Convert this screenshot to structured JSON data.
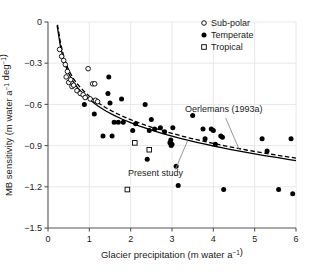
{
  "chart_data": {
    "type": "scatter",
    "title": "",
    "xlabel": "Glacier precipitation (m water a⁻¹)",
    "ylabel": "MB sensitivity (m water a⁻¹ deg⁻¹)",
    "xlim": [
      0,
      6
    ],
    "ylim": [
      -1.5,
      0
    ],
    "xticks": [
      "0",
      "1",
      "2",
      "3",
      "4",
      "5",
      "6"
    ],
    "yticks": [
      "0",
      "−0.3",
      "−0.6",
      "−0.9",
      "−1.2",
      "−1.5"
    ],
    "xtick_values": [
      0,
      1,
      2,
      3,
      4,
      5,
      6
    ],
    "ytick_values": [
      0,
      -0.3,
      -0.6,
      -0.9,
      -1.2,
      -1.5
    ],
    "grid": true,
    "grid_color": "#e8e8e8",
    "legend_position": "top-right",
    "legend": [
      {
        "label": "Sub-polar",
        "marker": "open-circle"
      },
      {
        "label": "Temperate",
        "marker": "filled-circle"
      },
      {
        "label": "Tropical",
        "marker": "open-square"
      }
    ],
    "series": [
      {
        "name": "Sub-polar",
        "marker": "open-circle",
        "color": "#000000",
        "points": [
          [
            0.28,
            -0.2
          ],
          [
            0.33,
            -0.25
          ],
          [
            0.38,
            -0.28
          ],
          [
            0.42,
            -0.31
          ],
          [
            0.44,
            -0.4
          ],
          [
            0.47,
            -0.36
          ],
          [
            0.5,
            -0.44
          ],
          [
            0.55,
            -0.42
          ],
          [
            0.58,
            -0.47
          ],
          [
            0.62,
            -0.46
          ],
          [
            0.7,
            -0.5
          ],
          [
            0.78,
            -0.52
          ],
          [
            0.85,
            -0.53
          ],
          [
            0.9,
            -0.55
          ],
          [
            0.97,
            -0.34
          ],
          [
            1.02,
            -0.56
          ],
          [
            1.08,
            -0.45
          ],
          [
            1.13,
            -0.45
          ],
          [
            1.15,
            -0.57
          ],
          [
            1.2,
            -0.58
          ]
        ]
      },
      {
        "name": "Temperate",
        "marker": "filled-circle",
        "color": "#000000",
        "points": [
          [
            0.88,
            -0.6
          ],
          [
            1.12,
            -0.67
          ],
          [
            1.33,
            -0.83
          ],
          [
            1.45,
            -0.52
          ],
          [
            1.47,
            -0.4
          ],
          [
            1.5,
            -0.59
          ],
          [
            1.55,
            -0.83
          ],
          [
            1.6,
            -0.73
          ],
          [
            1.7,
            -0.73
          ],
          [
            1.78,
            -0.56
          ],
          [
            1.82,
            -0.73
          ],
          [
            2.05,
            -0.79
          ],
          [
            2.12,
            -0.74
          ],
          [
            2.35,
            -0.6
          ],
          [
            2.4,
            -1.0
          ],
          [
            2.45,
            -0.79
          ],
          [
            2.5,
            -0.71
          ],
          [
            2.58,
            -0.78
          ],
          [
            2.72,
            -0.77
          ],
          [
            2.82,
            -0.8
          ],
          [
            2.95,
            -0.88
          ],
          [
            2.97,
            -0.86
          ],
          [
            2.98,
            -0.9
          ],
          [
            3.0,
            -0.89
          ],
          [
            3.02,
            -0.77
          ],
          [
            3.1,
            -1.05
          ],
          [
            3.15,
            -1.19
          ],
          [
            3.5,
            -0.68
          ],
          [
            3.75,
            -0.78
          ],
          [
            3.8,
            -0.85
          ],
          [
            3.95,
            -0.78
          ],
          [
            4.0,
            -0.79
          ],
          [
            4.05,
            -0.89
          ],
          [
            4.18,
            -0.83
          ],
          [
            4.22,
            -0.84
          ],
          [
            4.25,
            -1.22
          ],
          [
            5.18,
            -0.85
          ],
          [
            5.3,
            -0.94
          ],
          [
            5.58,
            -1.22
          ],
          [
            5.88,
            -0.85
          ],
          [
            5.92,
            -1.25
          ]
        ]
      },
      {
        "name": "Tropical",
        "marker": "open-square",
        "color": "#000000",
        "points": [
          [
            2.1,
            -0.88
          ],
          [
            2.45,
            -0.93
          ],
          [
            1.92,
            -1.22
          ]
        ]
      }
    ],
    "curves": [
      {
        "name": "Present study",
        "style": "solid",
        "color": "#000000",
        "points": [
          [
            0.22,
            -0.025
          ],
          [
            0.3,
            -0.175
          ],
          [
            0.4,
            -0.3
          ],
          [
            0.5,
            -0.375
          ],
          [
            0.6,
            -0.43
          ],
          [
            0.7,
            -0.473
          ],
          [
            0.8,
            -0.508
          ],
          [
            0.9,
            -0.538
          ],
          [
            1.0,
            -0.565
          ],
          [
            1.2,
            -0.61
          ],
          [
            1.4,
            -0.648
          ],
          [
            1.6,
            -0.68
          ],
          [
            1.8,
            -0.708
          ],
          [
            2.0,
            -0.733
          ],
          [
            2.2,
            -0.756
          ],
          [
            2.4,
            -0.777
          ],
          [
            2.6,
            -0.796
          ],
          [
            2.8,
            -0.814
          ],
          [
            3.0,
            -0.831
          ],
          [
            3.2,
            -0.847
          ],
          [
            3.4,
            -0.862
          ],
          [
            3.6,
            -0.876
          ],
          [
            3.8,
            -0.89
          ],
          [
            4.0,
            -0.903
          ],
          [
            4.2,
            -0.915
          ],
          [
            4.4,
            -0.927
          ],
          [
            4.6,
            -0.939
          ],
          [
            4.8,
            -0.95
          ],
          [
            5.0,
            -0.96
          ],
          [
            5.2,
            -0.971
          ],
          [
            5.4,
            -0.981
          ],
          [
            5.6,
            -0.99
          ],
          [
            5.8,
            -1.0
          ],
          [
            6.0,
            -1.009
          ]
        ]
      },
      {
        "name": "Oerlemans (1993a)",
        "style": "dashed",
        "color": "#000000",
        "points": [
          [
            0.23,
            -0.02
          ],
          [
            0.3,
            -0.15
          ],
          [
            0.4,
            -0.275
          ],
          [
            0.5,
            -0.35
          ],
          [
            0.6,
            -0.405
          ],
          [
            0.7,
            -0.448
          ],
          [
            0.8,
            -0.483
          ],
          [
            0.9,
            -0.513
          ],
          [
            1.0,
            -0.54
          ],
          [
            1.2,
            -0.586
          ],
          [
            1.4,
            -0.624
          ],
          [
            1.6,
            -0.657
          ],
          [
            1.8,
            -0.685
          ],
          [
            2.0,
            -0.711
          ],
          [
            2.2,
            -0.734
          ],
          [
            2.4,
            -0.756
          ],
          [
            2.6,
            -0.775
          ],
          [
            2.8,
            -0.794
          ],
          [
            3.0,
            -0.811
          ],
          [
            3.2,
            -0.827
          ],
          [
            3.4,
            -0.843
          ],
          [
            3.6,
            -0.857
          ],
          [
            3.8,
            -0.871
          ],
          [
            4.0,
            -0.884
          ],
          [
            4.2,
            -0.897
          ],
          [
            4.4,
            -0.909
          ],
          [
            4.6,
            -0.921
          ],
          [
            4.8,
            -0.932
          ],
          [
            5.0,
            -0.943
          ],
          [
            5.2,
            -0.953
          ],
          [
            5.4,
            -0.963
          ],
          [
            5.6,
            -0.973
          ],
          [
            5.8,
            -0.982
          ],
          [
            6.0,
            -0.991
          ]
        ]
      }
    ],
    "annotations": [
      {
        "text": "Oerlemans (1993a)",
        "text_x": 4.25,
        "text_y": -0.655,
        "leader_from": [
          4.3,
          -0.7
        ],
        "leader_to": [
          4.62,
          -0.925
        ]
      },
      {
        "text": "Present study",
        "text_x": 2.6,
        "text_y": -1.12,
        "leader_from": [
          3.08,
          -1.075
        ],
        "leader_to": [
          3.38,
          -0.862
        ]
      }
    ]
  }
}
